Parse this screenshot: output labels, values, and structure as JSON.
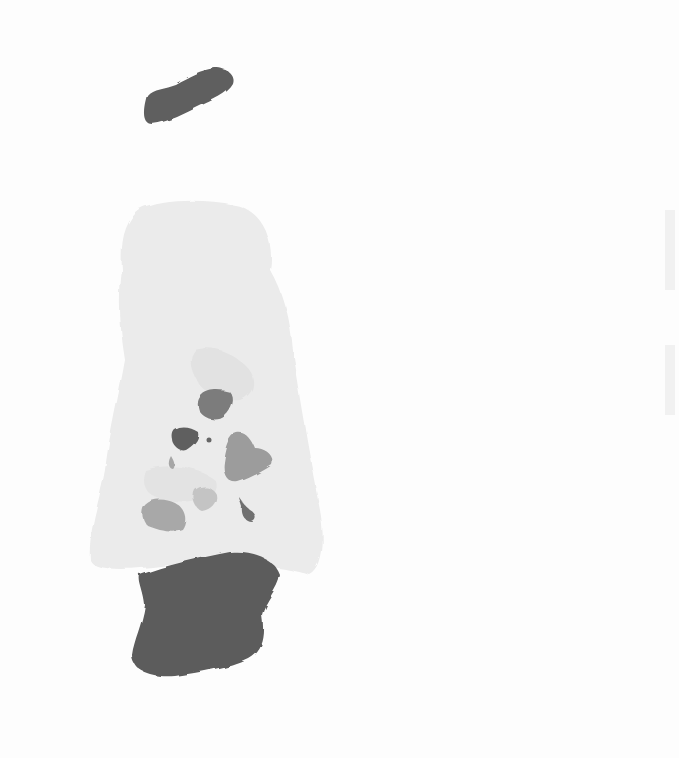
{
  "image": {
    "description": "Grayscale watercolor abstract painting: a pale wash figure shape with darker blots inside, a dark blob above, and a large dark blob at the base",
    "colors": {
      "paper": "#fdfdfd",
      "light_wash": "#e9e9e9",
      "mid_wash": "#dcdcdc",
      "dark_blob": "#5c5c5c",
      "mid_blot": "#8a8a8a",
      "soft_blot": "#b8b8b8"
    }
  }
}
